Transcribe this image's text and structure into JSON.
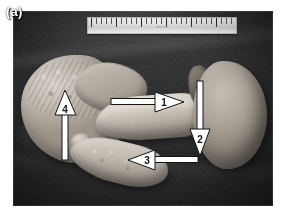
{
  "figure": {
    "panel_label": "(a)",
    "type": "gross-pathology-specimen-photograph",
    "color_mode": "grayscale",
    "background_description": "dark cloth drape",
    "palette": {
      "page_background": "#ffffff",
      "photo_background_dark": "#2c2c2c",
      "tissue_light": "#ddd6cc",
      "tissue_mid": "#aaa198",
      "tissue_dark": "#7d756c",
      "annotation_fill": "#ffffff",
      "annotation_stroke": "#141414",
      "label_text": "#ffffff"
    }
  },
  "scale_bar": {
    "name": "ruler",
    "visible": true,
    "printed_text": "mm cm",
    "position": "top-center"
  },
  "annotations": [
    {
      "id": "arrow-1",
      "number": "1",
      "direction": "right",
      "tip_x": 170,
      "tip_y": 90,
      "tail_x": 100,
      "tail_y": 90
    },
    {
      "id": "arrow-2",
      "number": "2",
      "direction": "down",
      "tip_x": 199,
      "tip_y": 143,
      "tail_x": 199,
      "tail_y": 83
    },
    {
      "id": "arrow-3",
      "number": "3",
      "direction": "left",
      "tip_x": 130,
      "tip_y": 148,
      "tail_x": 196,
      "tail_y": 148
    },
    {
      "id": "arrow-4",
      "number": "4",
      "direction": "up",
      "tip_x": 64,
      "tip_y": 95,
      "tail_x": 64,
      "tail_y": 155
    }
  ],
  "specimen_parts": [
    {
      "name": "left-lobulated-mass",
      "description": "lobulated pale tissue mass, left"
    },
    {
      "name": "central-elongated-band",
      "description": "elongated pale band crossing centre"
    },
    {
      "name": "right-rounded-organ",
      "description": "smooth rounded organ, right"
    },
    {
      "name": "lower-tubular-segment",
      "description": "tubular segment extending inferiorly"
    }
  ]
}
